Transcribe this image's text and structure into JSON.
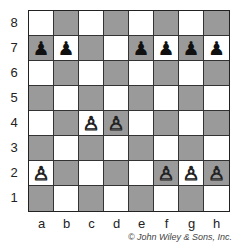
{
  "board": {
    "ranks": [
      "8",
      "7",
      "6",
      "5",
      "4",
      "3",
      "2",
      "1"
    ],
    "files": [
      "a",
      "b",
      "c",
      "d",
      "e",
      "f",
      "g",
      "h"
    ],
    "colors": {
      "light": "#ffffff",
      "dark": "#9a9a9a"
    },
    "pieces": [
      {
        "square": "a7",
        "type": "pawn",
        "color": "black",
        "glyph": "♟"
      },
      {
        "square": "b7",
        "type": "pawn",
        "color": "black",
        "glyph": "♟"
      },
      {
        "square": "e7",
        "type": "pawn",
        "color": "black",
        "glyph": "♟"
      },
      {
        "square": "f7",
        "type": "pawn",
        "color": "black",
        "glyph": "♟"
      },
      {
        "square": "g7",
        "type": "pawn",
        "color": "black",
        "glyph": "♟"
      },
      {
        "square": "h7",
        "type": "pawn",
        "color": "black",
        "glyph": "♟"
      },
      {
        "square": "c4",
        "type": "pawn",
        "color": "white",
        "glyph": "♙"
      },
      {
        "square": "d4",
        "type": "pawn",
        "color": "white",
        "glyph": "♙"
      },
      {
        "square": "a2",
        "type": "pawn",
        "color": "white",
        "glyph": "♙"
      },
      {
        "square": "f2",
        "type": "pawn",
        "color": "white",
        "glyph": "♙"
      },
      {
        "square": "g2",
        "type": "pawn",
        "color": "white",
        "glyph": "♙"
      },
      {
        "square": "h2",
        "type": "pawn",
        "color": "white",
        "glyph": "♙"
      }
    ]
  },
  "copyright": "© John Wiley & Sons, Inc."
}
